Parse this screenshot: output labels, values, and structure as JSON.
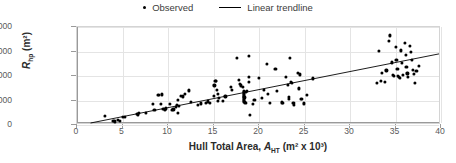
{
  "chart_data": {
    "type": "scatter",
    "title": "",
    "xlabel": "Hull Total Area, A_HT (m² x 10³)",
    "ylabel": "R_hp (m²)",
    "xlabel_parts": {
      "main": "Hull Total Area, ",
      "sym": "A",
      "sub": "HT",
      "units": " (m² x 10³)"
    },
    "ylabel_parts": {
      "sym": "R",
      "sub": "hp",
      "units": " (m²)"
    },
    "xlim": [
      0,
      40
    ],
    "ylim": [
      0,
      100000
    ],
    "xticks": [
      0,
      5,
      10,
      15,
      20,
      25,
      30,
      35,
      40
    ],
    "xtick_labels": [
      "0",
      "5",
      "10",
      "15",
      "20",
      "25",
      "30",
      "35",
      "40"
    ],
    "yticks": [
      0,
      25000,
      50000,
      75000,
      100000
    ],
    "ytick_labels": [
      "0",
      "25,000",
      "50,000",
      "75,000",
      "100,000"
    ],
    "grid": true,
    "legend_position": "top-center",
    "legend": [
      {
        "label": "Observed",
        "marker": "dot",
        "color": "#000000"
      },
      {
        "label": "Linear trendline",
        "marker": "line",
        "color": "#000000"
      }
    ],
    "trendline": {
      "label": "Linear trendline",
      "slope": 1870,
      "intercept": -2800,
      "x_start": 1.5,
      "x_end": 40,
      "y_start": 0,
      "y_end": 72000,
      "color": "#000000"
    },
    "series": [
      {
        "name": "Observed",
        "color": "#000000",
        "points": [
          [
            3.1,
            9500
          ],
          [
            4.0,
            4500
          ],
          [
            4.2,
            3600
          ],
          [
            4.5,
            5200
          ],
          [
            4.7,
            4300
          ],
          [
            5.0,
            8200
          ],
          [
            5.3,
            8100
          ],
          [
            6.6,
            11700
          ],
          [
            6.7,
            10900
          ],
          [
            6.8,
            12400
          ],
          [
            7.6,
            12600
          ],
          [
            8.3,
            21800
          ],
          [
            8.5,
            15600
          ],
          [
            8.9,
            31000
          ],
          [
            9.0,
            30800
          ],
          [
            9.3,
            31200
          ],
          [
            9.2,
            21300
          ],
          [
            9.5,
            16400
          ],
          [
            9.7,
            15800
          ],
          [
            9.8,
            16900
          ],
          [
            10.2,
            21400
          ],
          [
            10.4,
            15700
          ],
          [
            10.6,
            16000
          ],
          [
            10.9,
            18500
          ],
          [
            11.0,
            20200
          ],
          [
            11.2,
            19600
          ],
          [
            11.1,
            12300
          ],
          [
            11.1,
            25600
          ],
          [
            11.4,
            29600
          ],
          [
            11.6,
            29200
          ],
          [
            11.9,
            31400
          ],
          [
            12.3,
            35300
          ],
          [
            12.5,
            23200
          ],
          [
            13.3,
            20800
          ],
          [
            13.6,
            22100
          ],
          [
            14.2,
            22300
          ],
          [
            14.4,
            24100
          ],
          [
            14.6,
            22600
          ],
          [
            15.0,
            29400
          ],
          [
            15.1,
            40400
          ],
          [
            15.2,
            44600
          ],
          [
            15.3,
            45300
          ],
          [
            15.4,
            35700
          ],
          [
            15.5,
            31800
          ],
          [
            15.6,
            27800
          ],
          [
            15.5,
            24900
          ],
          [
            16.0,
            24700
          ],
          [
            16.3,
            29100
          ],
          [
            16.9,
            38900
          ],
          [
            17.0,
            35900
          ],
          [
            17.6,
            68300
          ],
          [
            17.8,
            45900
          ],
          [
            17.9,
            41700
          ],
          [
            18.0,
            40400
          ],
          [
            18.2,
            38600
          ],
          [
            18.3,
            35200
          ],
          [
            18.3,
            33700
          ],
          [
            18.35,
            32900
          ],
          [
            18.3,
            31500
          ],
          [
            18.35,
            30400
          ],
          [
            18.3,
            29200
          ],
          [
            18.4,
            28100
          ],
          [
            18.3,
            27000
          ],
          [
            18.35,
            25900
          ],
          [
            18.3,
            24800
          ],
          [
            18.4,
            23900
          ],
          [
            18.5,
            22600
          ],
          [
            18.6,
            33600
          ],
          [
            18.7,
            34600
          ],
          [
            18.9,
            70400
          ],
          [
            18.9,
            49200
          ],
          [
            18.9,
            44300
          ],
          [
            19.0,
            9900
          ],
          [
            19.3,
            21200
          ],
          [
            19.5,
            25300
          ],
          [
            20.0,
            47700
          ],
          [
            20.3,
            27600
          ],
          [
            20.5,
            36100
          ],
          [
            20.9,
            62000
          ],
          [
            21.0,
            31400
          ],
          [
            21.2,
            22500
          ],
          [
            21.8,
            57500
          ],
          [
            22.0,
            34900
          ],
          [
            22.5,
            23000
          ],
          [
            22.6,
            22300
          ],
          [
            23.0,
            48900
          ],
          [
            23.2,
            40600
          ],
          [
            23.3,
            28500
          ],
          [
            23.3,
            26400
          ],
          [
            23.4,
            68800
          ],
          [
            23.5,
            43900
          ],
          [
            23.6,
            42900
          ],
          [
            23.7,
            22200
          ],
          [
            23.8,
            22800
          ],
          [
            23.8,
            20900
          ],
          [
            24.3,
            53300
          ],
          [
            24.4,
            37300
          ],
          [
            24.5,
            51600
          ],
          [
            24.6,
            26300
          ],
          [
            24.7,
            26900
          ],
          [
            24.9,
            22100
          ],
          [
            25.3,
            30400
          ],
          [
            25.9,
            47600
          ],
          [
            33.0,
            43200
          ],
          [
            33.2,
            75400
          ],
          [
            33.4,
            45100
          ],
          [
            33.5,
            53200
          ],
          [
            33.8,
            44300
          ],
          [
            34.0,
            55700
          ],
          [
            34.3,
            85500
          ],
          [
            34.4,
            91400
          ],
          [
            34.6,
            63900
          ],
          [
            34.7,
            50800
          ],
          [
            34.8,
            50300
          ],
          [
            35.0,
            79800
          ],
          [
            35.1,
            66600
          ],
          [
            35.2,
            57000
          ],
          [
            35.3,
            50100
          ],
          [
            35.4,
            49200
          ],
          [
            35.5,
            48100
          ],
          [
            35.6,
            76200
          ],
          [
            35.7,
            63500
          ],
          [
            35.8,
            51400
          ],
          [
            36.0,
            83900
          ],
          [
            36.1,
            71800
          ],
          [
            36.2,
            59600
          ],
          [
            36.3,
            52600
          ],
          [
            36.4,
            48800
          ],
          [
            36.6,
            80800
          ],
          [
            36.7,
            74400
          ],
          [
            36.8,
            66800
          ],
          [
            36.9,
            56200
          ],
          [
            37.0,
            52100
          ],
          [
            37.1,
            42800
          ],
          [
            37.3,
            55300
          ],
          [
            37.6,
            59900
          ]
        ]
      }
    ]
  }
}
